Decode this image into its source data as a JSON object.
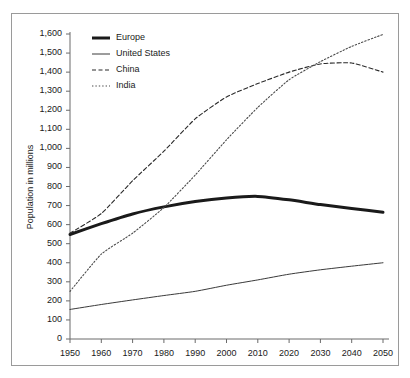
{
  "chart_data": {
    "type": "line",
    "title": "",
    "subtitle": "",
    "xlabel": "",
    "ylabel": "Population in millions",
    "xlim": [
      1950,
      2050
    ],
    "ylim": [
      0,
      1600
    ],
    "ytick_step": 100,
    "xtick_step": 10,
    "grid": false,
    "legend_position": "top-left-inside",
    "x": [
      1950,
      1960,
      1970,
      1980,
      1990,
      2000,
      2010,
      2020,
      2030,
      2040,
      2050
    ],
    "xtick_labels": [
      "1950",
      "1960",
      "1970",
      "1980",
      "1990",
      "2000",
      "2010",
      "2020",
      "2030",
      "2040",
      "2050"
    ],
    "ytick_labels": [
      "0",
      "100",
      "200",
      "300",
      "400",
      "500",
      "600",
      "700",
      "800",
      "900",
      "1,000",
      "1,100",
      "1,200",
      "1,300",
      "1,400",
      "1,500",
      "1,600"
    ],
    "ytick_values": [
      0,
      100,
      200,
      300,
      400,
      500,
      600,
      700,
      800,
      900,
      1000,
      1100,
      1200,
      1300,
      1400,
      1500,
      1600
    ],
    "series": [
      {
        "name": "Europe",
        "style": "solid-thick",
        "color": "#1a1a1a",
        "width": 3.0,
        "values": [
          548,
          605,
          656,
          693,
          721,
          740,
          748,
          730,
          705,
          685,
          665
        ]
      },
      {
        "name": "United States",
        "style": "solid-thin",
        "color": "#3a3a3a",
        "width": 1.0,
        "values": [
          155,
          181,
          205,
          228,
          250,
          282,
          310,
          340,
          363,
          382,
          400
        ]
      },
      {
        "name": "China",
        "style": "dashed",
        "color": "#2a2a2a",
        "width": 1.1,
        "values": [
          555,
          658,
          830,
          985,
          1155,
          1270,
          1340,
          1400,
          1443,
          1448,
          1400
        ]
      },
      {
        "name": "India",
        "style": "dotted",
        "color": "#4a4a4a",
        "width": 1.1,
        "values": [
          250,
          445,
          555,
          690,
          860,
          1045,
          1215,
          1360,
          1455,
          1535,
          1598
        ]
      }
    ]
  },
  "legend": {
    "items": [
      {
        "label": "Europe",
        "style": "solid-thick"
      },
      {
        "label": "United States",
        "style": "solid-thin"
      },
      {
        "label": "China",
        "style": "dashed"
      },
      {
        "label": "India",
        "style": "dotted"
      }
    ]
  },
  "colors": {
    "frame": "#9a9a9a",
    "axis": "#6a6a6a",
    "background": "#ffffff",
    "text": "#1a1a1a"
  }
}
